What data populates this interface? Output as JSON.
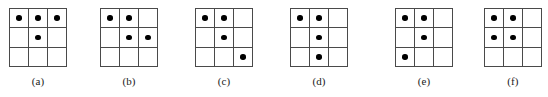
{
  "figure": {
    "type": "dot-grid-panels",
    "background_color": "#ffffff",
    "grid_line_color": "#4a4a4a",
    "dot_color": "#000000",
    "rows": 3,
    "columns": 3,
    "panel_count": 6
  },
  "panels": [
    {
      "id": "a",
      "label": "(a)",
      "left": 0,
      "dots": [
        [
          1,
          1,
          1
        ],
        [
          0,
          1,
          0
        ],
        [
          0,
          0,
          0
        ]
      ],
      "dot_count": 4,
      "dot_positions": "r1c1, r1c2, r1c3, r2c2"
    },
    {
      "id": "b",
      "label": "(b)",
      "left": 91,
      "dots": [
        [
          1,
          1,
          0
        ],
        [
          0,
          1,
          1
        ],
        [
          0,
          0,
          0
        ]
      ],
      "dot_count": 4,
      "dot_positions": "r1c1, r1c2, r2c2, r2c3"
    },
    {
      "id": "c",
      "label": "(c)",
      "left": 186,
      "dots": [
        [
          1,
          1,
          0
        ],
        [
          0,
          1,
          0
        ],
        [
          0,
          0,
          1
        ]
      ],
      "dot_count": 4,
      "dot_positions": "r1c1, r1c2, r2c2, r3c3"
    },
    {
      "id": "d",
      "label": "(d)",
      "left": 281,
      "dots": [
        [
          1,
          1,
          0
        ],
        [
          0,
          1,
          0
        ],
        [
          0,
          1,
          0
        ]
      ],
      "dot_count": 4,
      "dot_positions": "r1c1, r1c2, r2c2, r3c2"
    },
    {
      "id": "e",
      "label": "(e)",
      "left": 386,
      "dots": [
        [
          1,
          1,
          0
        ],
        [
          0,
          1,
          0
        ],
        [
          1,
          0,
          0
        ]
      ],
      "dot_count": 4,
      "dot_positions": "r1c1, r1c2, r2c2, r3c1"
    },
    {
      "id": "f",
      "label": "(f)",
      "left": 475,
      "dots": [
        [
          1,
          1,
          0
        ],
        [
          1,
          1,
          0
        ],
        [
          0,
          0,
          0
        ]
      ],
      "dot_count": 4,
      "dot_positions": "r1c1, r1c2, r2c1, r2c2"
    }
  ]
}
